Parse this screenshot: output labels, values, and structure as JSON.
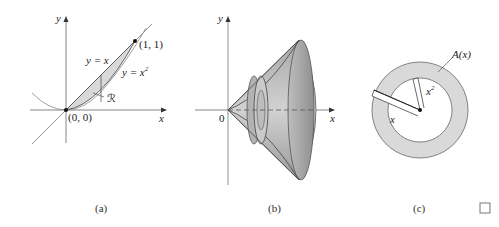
{
  "figure": {
    "panels": [
      {
        "id": "a",
        "caption": "(a)",
        "axis_x_label": "x",
        "axis_y_label": "y",
        "curve_line_label": "y = x",
        "curve_parabola_label": "y = x",
        "curve_parabola_exponent": "2",
        "point_origin_label": "(0, 0)",
        "point_top_label": "(1, 1)",
        "region_label": "ℛ"
      },
      {
        "id": "b",
        "caption": "(b)",
        "axis_x_label": "x",
        "axis_y_label": "y",
        "origin_label": "0"
      },
      {
        "id": "c",
        "caption": "(c)",
        "area_label": "A(x)",
        "outer_radius_label": "x",
        "inner_radius_label": "x",
        "inner_radius_exponent": "2"
      }
    ],
    "end_mark": "□",
    "colors": {
      "shade": "#d9d9d9",
      "cone_fill": "#bfbfbf",
      "line": "#555555",
      "axis": "#666666"
    }
  }
}
